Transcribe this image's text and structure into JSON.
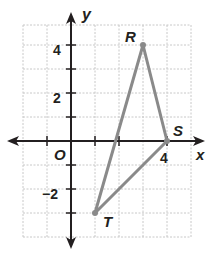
{
  "axes": {
    "x_label": "x",
    "y_label": "y",
    "origin_label": "O"
  },
  "ticks": {
    "x": [
      {
        "value": 4,
        "label": "4"
      }
    ],
    "y": [
      {
        "value": 4,
        "label": "4"
      },
      {
        "value": 2,
        "label": "2"
      },
      {
        "value": -2,
        "label": "−2"
      }
    ]
  },
  "points": [
    {
      "name": "R",
      "x": 3,
      "y": 4
    },
    {
      "name": "S",
      "x": 4,
      "y": 0
    },
    {
      "name": "T",
      "x": 1,
      "y": -3
    }
  ],
  "colors": {
    "triangle": "#8a8a8a",
    "grid": "#c8c8c8",
    "axis": "#231f20"
  }
}
